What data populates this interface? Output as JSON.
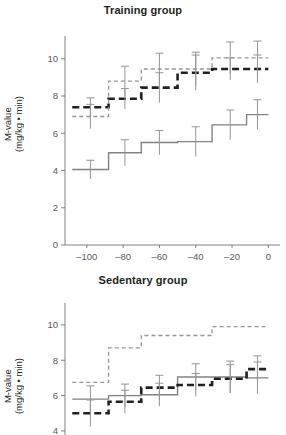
{
  "figure": {
    "ylabel_line1": "M-value",
    "ylabel_line2": "(mg/kg • min)"
  },
  "chart_data": [
    {
      "type": "line",
      "subtype": "step-post",
      "title": "Training group",
      "xlabel": "",
      "ylabel": "M-value (mg/kg • min)",
      "xlim": [
        -112,
        2
      ],
      "ylim": [
        0,
        10.9
      ],
      "xticks": [
        -100,
        -80,
        -60,
        -40,
        -20,
        0
      ],
      "xtick_labels": [
        "–100",
        "–80",
        "–60",
        "–40",
        "–20",
        "0"
      ],
      "yticks": [
        0,
        2,
        4,
        6,
        8,
        10
      ],
      "ytick_labels": [
        "0",
        "2",
        "4",
        "6",
        "8",
        "10"
      ],
      "grid": false,
      "legend": "none",
      "step_edges": [
        -108,
        -88,
        -70,
        -50,
        -31,
        -12,
        0
      ],
      "error_x": [
        -98,
        -79,
        -60,
        -40,
        -21,
        -6
      ],
      "series": [
        {
          "name": "solid-gray",
          "style": "solid",
          "color": "#808285",
          "values": [
            4.05,
            4.95,
            5.5,
            5.55,
            6.45,
            7.0
          ],
          "errors": [
            0.5,
            0.7,
            0.65,
            0.8,
            0.8,
            0.8
          ]
        },
        {
          "name": "thick-black-dashed",
          "style": "dashed-thick",
          "color": "#231f20",
          "values": [
            7.4,
            7.85,
            8.45,
            9.25,
            9.45,
            9.45
          ],
          "errors": [
            0.5,
            0.55,
            0.8,
            0.95,
            0.6,
            0.75
          ]
        },
        {
          "name": "thin-gray-dashed",
          "style": "dashed-thin",
          "color": "#939598",
          "values": [
            6.9,
            8.8,
            9.45,
            9.45,
            10.05,
            10.05
          ],
          "errors": [
            0.65,
            0.8,
            0.85,
            0.9,
            0.85,
            0.9
          ]
        }
      ]
    },
    {
      "type": "line",
      "subtype": "step-post",
      "title": "Sedentary group",
      "xlabel": "",
      "ylabel": "M-value (mg/kg • min)",
      "xlim": [
        -112,
        2
      ],
      "ylim": [
        3.6,
        10.9
      ],
      "xticks": [
        -100,
        -80,
        -60,
        -40,
        -20,
        0
      ],
      "xtick_labels": [
        "–100",
        "–80",
        "–60",
        "–40",
        "–20",
        "0"
      ],
      "yticks": [
        4,
        6,
        8,
        10
      ],
      "ytick_labels": [
        "4",
        "6",
        "8",
        "10"
      ],
      "grid": false,
      "legend": "none",
      "step_edges": [
        -108,
        -88,
        -70,
        -50,
        -31,
        -12,
        0
      ],
      "error_x": [
        -98,
        -79,
        -60,
        -40,
        -21,
        -6
      ],
      "series": [
        {
          "name": "solid-gray",
          "style": "solid",
          "color": "#808285",
          "values": [
            5.8,
            6.0,
            6.05,
            7.05,
            7.05,
            7.0
          ],
          "errors": [
            0.75,
            0.65,
            0.65,
            0.75,
            0.9,
            0.9
          ]
        },
        {
          "name": "thick-black-dashed",
          "style": "dashed-thick",
          "color": "#231f20",
          "values": [
            5.0,
            5.65,
            6.45,
            6.6,
            6.95,
            7.5
          ],
          "errors": [
            0.75,
            0.65,
            0.7,
            0.65,
            0.8,
            0.75
          ]
        },
        {
          "name": "thin-gray-dashed",
          "style": "dashed-thin",
          "color": "#939598",
          "values": [
            6.75,
            8.7,
            9.4,
            9.4,
            9.9,
            9.9
          ]
        }
      ]
    }
  ]
}
